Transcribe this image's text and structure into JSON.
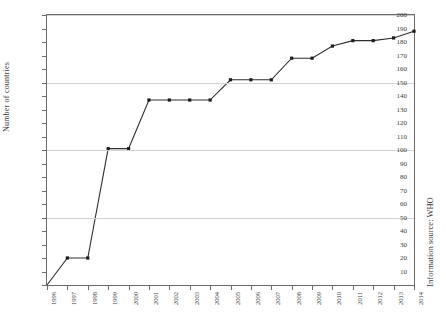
{
  "chart_data": {
    "type": "line",
    "title": "",
    "xlabel": "",
    "ylabel": "Number of countries",
    "annotation": "Information source: WHO",
    "grid": "horizontal major only (50, 100, 150, 200)",
    "legend": "none",
    "xlim": [
      1996,
      2014
    ],
    "ylim": [
      0,
      200
    ],
    "ytick_step": 10,
    "gridline_values": [
      50,
      100,
      150,
      200
    ],
    "x": [
      1996,
      1997,
      1998,
      1999,
      2000,
      2001,
      2002,
      2003,
      2004,
      2005,
      2006,
      2007,
      2008,
      2009,
      2010,
      2011,
      2012,
      2013,
      2014
    ],
    "categories": [
      "1996",
      "1997",
      "1998",
      "1999",
      "2000",
      "2001",
      "2002",
      "2003",
      "2004",
      "2005",
      "2006",
      "2007",
      "2008",
      "2009",
      "2010",
      "2011",
      "2012",
      "2013",
      "2014"
    ],
    "values": [
      0,
      20,
      20,
      101,
      101,
      137,
      137,
      137,
      137,
      152,
      152,
      152,
      168,
      168,
      177,
      181,
      181,
      183,
      188
    ],
    "ytick_labels": [
      "200",
      "190",
      "180",
      "170",
      "160",
      "150",
      "140",
      "130",
      "120",
      "110",
      "100",
      "90",
      "80",
      "70",
      "60",
      "50",
      "40",
      "30",
      "20",
      "10",
      "0"
    ],
    "series": [
      {
        "name": "Number of countries",
        "values": [
          0,
          20,
          20,
          101,
          101,
          137,
          137,
          137,
          137,
          152,
          152,
          152,
          168,
          168,
          177,
          181,
          181,
          183,
          188
        ],
        "color": "#2e2e2e",
        "marker": "square"
      }
    ]
  }
}
